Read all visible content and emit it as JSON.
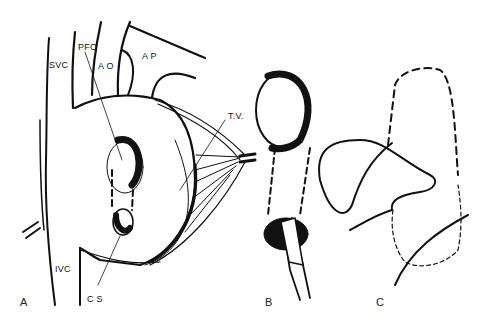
{
  "figure": {
    "panels": [
      {
        "id": "A",
        "label": "A"
      },
      {
        "id": "B",
        "label": "B"
      },
      {
        "id": "C",
        "label": "C"
      }
    ],
    "labels": {
      "svc": "SVC",
      "pfo": "PFO",
      "ao": "A O",
      "ap": "A P",
      "tv": "T.V.",
      "ivc": "IVC",
      "cs": "C S"
    },
    "colors": {
      "ink": "#111111",
      "background": "#ffffff"
    }
  }
}
